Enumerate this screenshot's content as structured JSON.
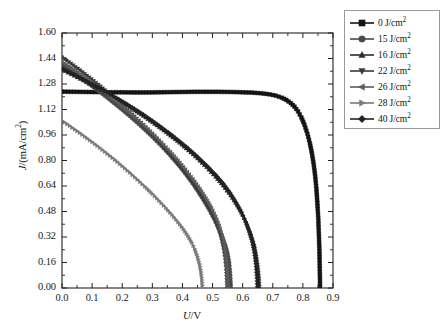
{
  "chart_data": {
    "type": "line",
    "title": "",
    "xlabel": "U/V",
    "ylabel": "J/(mA/cm2)",
    "xlabel_parts": {
      "symbol": "U",
      "unit": "/V"
    },
    "ylabel_parts": {
      "symbol": "J",
      "unit": "/(mA/cm",
      "exp": "2",
      "close": ")"
    },
    "xlim": [
      0.0,
      0.9
    ],
    "ylim": [
      0.0,
      1.6
    ],
    "xticks": [
      "0.0",
      "0.1",
      "0.2",
      "0.3",
      "0.4",
      "0.5",
      "0.6",
      "0.7",
      "0.8",
      "0.9"
    ],
    "yticks": [
      "0.00",
      "0.16",
      "0.32",
      "0.48",
      "0.64",
      "0.80",
      "0.96",
      "1.12",
      "1.28",
      "1.44",
      "1.60"
    ],
    "xtick_values": [
      0.0,
      0.1,
      0.2,
      0.3,
      0.4,
      0.5,
      0.6,
      0.7,
      0.8,
      0.9
    ],
    "ytick_values": [
      0.0,
      0.16,
      0.32,
      0.48,
      0.64,
      0.8,
      0.96,
      1.12,
      1.28,
      1.44,
      1.6
    ],
    "grid": false,
    "minor_ticks": true,
    "legend_position": "outside-top-right",
    "legend_title": "",
    "series": [
      {
        "name": "0 J/cm2",
        "label_value": "0",
        "label_unit": "J/cm",
        "label_exp": "2",
        "marker": "square",
        "color": "#151515",
        "jsc": 1.23,
        "voc": 0.855,
        "points": [
          [
            0.0,
            1.232
          ],
          [
            0.04,
            1.231
          ],
          [
            0.08,
            1.23
          ],
          [
            0.12,
            1.229
          ],
          [
            0.16,
            1.228
          ],
          [
            0.2,
            1.228
          ],
          [
            0.24,
            1.227
          ],
          [
            0.28,
            1.227
          ],
          [
            0.32,
            1.228
          ],
          [
            0.36,
            1.229
          ],
          [
            0.4,
            1.23
          ],
          [
            0.44,
            1.231
          ],
          [
            0.48,
            1.231
          ],
          [
            0.52,
            1.231
          ],
          [
            0.56,
            1.23
          ],
          [
            0.6,
            1.228
          ],
          [
            0.63,
            1.226
          ],
          [
            0.66,
            1.222
          ],
          [
            0.69,
            1.215
          ],
          [
            0.71,
            1.207
          ],
          [
            0.73,
            1.194
          ],
          [
            0.745,
            1.18
          ],
          [
            0.76,
            1.16
          ],
          [
            0.772,
            1.138
          ],
          [
            0.784,
            1.108
          ],
          [
            0.795,
            1.07
          ],
          [
            0.805,
            1.025
          ],
          [
            0.815,
            0.968
          ],
          [
            0.823,
            0.91
          ],
          [
            0.83,
            0.845
          ],
          [
            0.836,
            0.775
          ],
          [
            0.841,
            0.7
          ],
          [
            0.845,
            0.62
          ],
          [
            0.848,
            0.535
          ],
          [
            0.851,
            0.44
          ],
          [
            0.853,
            0.34
          ],
          [
            0.855,
            0.23
          ],
          [
            0.856,
            0.12
          ],
          [
            0.857,
            0.01
          ]
        ]
      },
      {
        "name": "15 J/cm2",
        "label_value": "15",
        "label_unit": "J/cm",
        "label_exp": "2",
        "marker": "circle",
        "color": "#4a4a4a",
        "jsc": 1.4,
        "voc": 0.555,
        "points": [
          [
            0.0,
            1.4
          ],
          [
            0.03,
            1.362
          ],
          [
            0.06,
            1.322
          ],
          [
            0.09,
            1.281
          ],
          [
            0.12,
            1.239
          ],
          [
            0.15,
            1.195
          ],
          [
            0.18,
            1.15
          ],
          [
            0.21,
            1.103
          ],
          [
            0.24,
            1.054
          ],
          [
            0.27,
            1.003
          ],
          [
            0.3,
            0.949
          ],
          [
            0.33,
            0.892
          ],
          [
            0.36,
            0.831
          ],
          [
            0.39,
            0.765
          ],
          [
            0.415,
            0.705
          ],
          [
            0.44,
            0.64
          ],
          [
            0.465,
            0.568
          ],
          [
            0.485,
            0.505
          ],
          [
            0.505,
            0.434
          ],
          [
            0.52,
            0.375
          ],
          [
            0.533,
            0.318
          ],
          [
            0.543,
            0.265
          ],
          [
            0.55,
            0.215
          ],
          [
            0.555,
            0.16
          ],
          [
            0.558,
            0.1
          ],
          [
            0.56,
            0.04
          ],
          [
            0.561,
            0.0
          ]
        ]
      },
      {
        "name": "16 J/cm2",
        "label_value": "16",
        "label_unit": "J/cm",
        "label_exp": "2",
        "marker": "triangle-up",
        "color": "#2b2b2b",
        "jsc": 1.37,
        "voc": 0.65,
        "points": [
          [
            0.0,
            1.37
          ],
          [
            0.03,
            1.341
          ],
          [
            0.06,
            1.312
          ],
          [
            0.09,
            1.282
          ],
          [
            0.12,
            1.251
          ],
          [
            0.15,
            1.219
          ],
          [
            0.18,
            1.186
          ],
          [
            0.21,
            1.152
          ],
          [
            0.24,
            1.116
          ],
          [
            0.27,
            1.079
          ],
          [
            0.3,
            1.04
          ],
          [
            0.33,
            0.999
          ],
          [
            0.36,
            0.956
          ],
          [
            0.39,
            0.911
          ],
          [
            0.42,
            0.863
          ],
          [
            0.45,
            0.812
          ],
          [
            0.48,
            0.757
          ],
          [
            0.51,
            0.697
          ],
          [
            0.535,
            0.642
          ],
          [
            0.56,
            0.58
          ],
          [
            0.582,
            0.518
          ],
          [
            0.6,
            0.458
          ],
          [
            0.615,
            0.4
          ],
          [
            0.628,
            0.34
          ],
          [
            0.638,
            0.278
          ],
          [
            0.645,
            0.212
          ],
          [
            0.65,
            0.145
          ],
          [
            0.654,
            0.075
          ],
          [
            0.656,
            0.005
          ]
        ]
      },
      {
        "name": "22 J/cm2",
        "label_value": "22",
        "label_unit": "J/cm",
        "label_exp": "2",
        "marker": "triangle-down",
        "color": "#3a3a3a",
        "jsc": 1.44,
        "voc": 0.535,
        "points": [
          [
            0.0,
            1.448
          ],
          [
            0.03,
            1.408
          ],
          [
            0.06,
            1.366
          ],
          [
            0.09,
            1.322
          ],
          [
            0.12,
            1.277
          ],
          [
            0.15,
            1.229
          ],
          [
            0.18,
            1.18
          ],
          [
            0.21,
            1.129
          ],
          [
            0.24,
            1.076
          ],
          [
            0.27,
            1.021
          ],
          [
            0.3,
            0.963
          ],
          [
            0.33,
            0.902
          ],
          [
            0.36,
            0.838
          ],
          [
            0.385,
            0.782
          ],
          [
            0.41,
            0.722
          ],
          [
            0.435,
            0.658
          ],
          [
            0.458,
            0.595
          ],
          [
            0.478,
            0.535
          ],
          [
            0.495,
            0.477
          ],
          [
            0.51,
            0.418
          ],
          [
            0.521,
            0.36
          ],
          [
            0.53,
            0.3
          ],
          [
            0.537,
            0.238
          ],
          [
            0.542,
            0.175
          ],
          [
            0.545,
            0.11
          ],
          [
            0.547,
            0.05
          ],
          [
            0.548,
            0.0
          ]
        ]
      },
      {
        "name": "26 J/cm2",
        "label_value": "26",
        "label_unit": "J/cm",
        "label_exp": "2",
        "marker": "triangle-left",
        "color": "#5c5c5c",
        "jsc": 1.42,
        "voc": 0.54,
        "points": [
          [
            0.0,
            1.42
          ],
          [
            0.03,
            1.382
          ],
          [
            0.06,
            1.343
          ],
          [
            0.09,
            1.302
          ],
          [
            0.12,
            1.26
          ],
          [
            0.15,
            1.216
          ],
          [
            0.18,
            1.171
          ],
          [
            0.21,
            1.124
          ],
          [
            0.24,
            1.075
          ],
          [
            0.27,
            1.024
          ],
          [
            0.3,
            0.97
          ],
          [
            0.33,
            0.913
          ],
          [
            0.36,
            0.853
          ],
          [
            0.385,
            0.8
          ],
          [
            0.41,
            0.743
          ],
          [
            0.435,
            0.682
          ],
          [
            0.458,
            0.621
          ],
          [
            0.478,
            0.562
          ],
          [
            0.496,
            0.503
          ],
          [
            0.51,
            0.448
          ],
          [
            0.522,
            0.39
          ],
          [
            0.531,
            0.33
          ],
          [
            0.538,
            0.266
          ],
          [
            0.543,
            0.2
          ],
          [
            0.547,
            0.132
          ],
          [
            0.549,
            0.062
          ],
          [
            0.55,
            0.0
          ]
        ]
      },
      {
        "name": "28 J/cm2",
        "label_value": "28",
        "label_unit": "J/cm",
        "label_exp": "2",
        "marker": "triangle-right",
        "color": "#7a7a7a",
        "jsc": 1.05,
        "voc": 0.46,
        "points": [
          [
            0.0,
            1.05
          ],
          [
            0.025,
            1.018
          ],
          [
            0.05,
            0.985
          ],
          [
            0.075,
            0.951
          ],
          [
            0.1,
            0.916
          ],
          [
            0.125,
            0.88
          ],
          [
            0.15,
            0.843
          ],
          [
            0.175,
            0.805
          ],
          [
            0.2,
            0.765
          ],
          [
            0.225,
            0.724
          ],
          [
            0.25,
            0.681
          ],
          [
            0.275,
            0.637
          ],
          [
            0.3,
            0.591
          ],
          [
            0.322,
            0.548
          ],
          [
            0.345,
            0.502
          ],
          [
            0.365,
            0.459
          ],
          [
            0.385,
            0.414
          ],
          [
            0.403,
            0.37
          ],
          [
            0.418,
            0.328
          ],
          [
            0.431,
            0.286
          ],
          [
            0.441,
            0.244
          ],
          [
            0.45,
            0.198
          ],
          [
            0.457,
            0.15
          ],
          [
            0.462,
            0.1
          ],
          [
            0.465,
            0.05
          ],
          [
            0.467,
            0.0
          ]
        ]
      },
      {
        "name": "40 J/cm2",
        "label_value": "40",
        "label_unit": "J/cm",
        "label_exp": "2",
        "marker": "diamond",
        "color": "#222222",
        "jsc": 1.375,
        "voc": 0.648,
        "points": [
          [
            0.0,
            1.378
          ],
          [
            0.03,
            1.349
          ],
          [
            0.06,
            1.32
          ],
          [
            0.09,
            1.29
          ],
          [
            0.12,
            1.259
          ],
          [
            0.15,
            1.227
          ],
          [
            0.18,
            1.194
          ],
          [
            0.21,
            1.16
          ],
          [
            0.24,
            1.125
          ],
          [
            0.27,
            1.088
          ],
          [
            0.3,
            1.049
          ],
          [
            0.33,
            1.008
          ],
          [
            0.36,
            0.966
          ],
          [
            0.39,
            0.921
          ],
          [
            0.42,
            0.874
          ],
          [
            0.45,
            0.823
          ],
          [
            0.48,
            0.769
          ],
          [
            0.51,
            0.71
          ],
          [
            0.535,
            0.656
          ],
          [
            0.558,
            0.597
          ],
          [
            0.578,
            0.537
          ],
          [
            0.596,
            0.475
          ],
          [
            0.61,
            0.415
          ],
          [
            0.622,
            0.352
          ],
          [
            0.632,
            0.288
          ],
          [
            0.639,
            0.222
          ],
          [
            0.644,
            0.152
          ],
          [
            0.647,
            0.08
          ],
          [
            0.649,
            0.008
          ]
        ]
      }
    ]
  },
  "axes": {
    "frame_color": "#222222"
  }
}
